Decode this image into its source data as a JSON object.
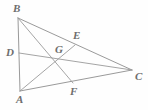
{
  "figure": {
    "name": "triangle-with-medians",
    "background_color": "#fefefe",
    "line_color": "#9a9a9a",
    "label_color": "#6d6d6d",
    "canvas": {
      "width": 148,
      "height": 110
    },
    "points": [
      {
        "id": "A",
        "label": "A",
        "x": 20,
        "y": 91,
        "label_x": 16,
        "label_y": 94,
        "kind": "vertex"
      },
      {
        "id": "B",
        "label": "B",
        "x": 18,
        "y": 18,
        "label_x": 13,
        "label_y": 3,
        "kind": "vertex"
      },
      {
        "id": "C",
        "label": "C",
        "x": 132,
        "y": 70,
        "label_x": 135,
        "label_y": 71,
        "kind": "vertex"
      },
      {
        "id": "D",
        "label": "D",
        "x": 19,
        "y": 53,
        "label_x": 6,
        "label_y": 47,
        "kind": "midpoint"
      },
      {
        "id": "E",
        "label": "E",
        "x": 75,
        "y": 45,
        "label_x": 73,
        "label_y": 30,
        "kind": "midpoint"
      },
      {
        "id": "F",
        "label": "F",
        "x": 73,
        "y": 83,
        "label_x": 70,
        "label_y": 86,
        "kind": "midpoint"
      },
      {
        "id": "G",
        "label": "G",
        "x": 61,
        "y": 61,
        "label_x": 55,
        "label_y": 44,
        "kind": "centroid"
      }
    ],
    "segments": [
      {
        "id": "side-AB",
        "from": "B",
        "to": "A",
        "role": "triangle-side"
      },
      {
        "id": "side-BC",
        "from": "B",
        "to": "C",
        "role": "triangle-side"
      },
      {
        "id": "side-AC",
        "from": "A",
        "to": "C",
        "role": "triangle-side"
      },
      {
        "id": "median-AE",
        "from": "A",
        "to": "E",
        "role": "median"
      },
      {
        "id": "median-BF",
        "from": "B",
        "to": "F",
        "role": "median"
      },
      {
        "id": "median-CD",
        "from": "C",
        "to": "D",
        "role": "median"
      }
    ]
  }
}
